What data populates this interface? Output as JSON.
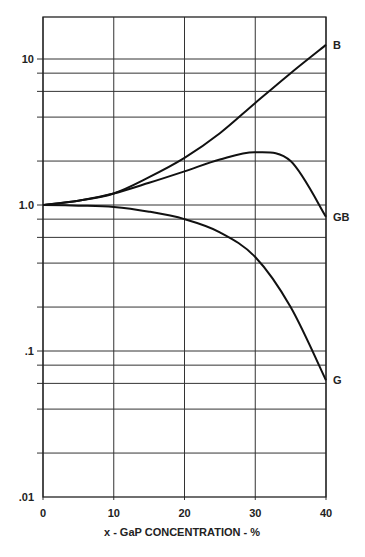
{
  "chart_data": {
    "type": "line",
    "title": "",
    "xlabel": "x - GaP CONCENTRATION - %",
    "ylabel": "",
    "yscale": "log",
    "xlim": [
      0,
      40
    ],
    "ylim": [
      0.01,
      20
    ],
    "grid": true,
    "x_ticks": [
      "0",
      "10",
      "20",
      "30",
      "40"
    ],
    "y_ticks": [
      ".01",
      ".1",
      "1.0",
      "10"
    ],
    "y_minor_grid": [
      0.02,
      0.04,
      0.06,
      0.08,
      0.2,
      0.4,
      0.6,
      0.8,
      2,
      4,
      6,
      8
    ],
    "x": [
      0,
      5,
      10,
      15,
      20,
      25,
      30,
      35,
      40
    ],
    "series": [
      {
        "name": "B",
        "values": [
          1.0,
          1.07,
          1.2,
          1.55,
          2.1,
          3.1,
          5.0,
          8.0,
          12.5
        ]
      },
      {
        "name": "GB",
        "values": [
          1.0,
          1.07,
          1.2,
          1.42,
          1.7,
          2.05,
          2.3,
          2.0,
          0.83
        ]
      },
      {
        "name": "G",
        "values": [
          1.0,
          0.99,
          0.97,
          0.9,
          0.8,
          0.65,
          0.44,
          0.2,
          0.063
        ]
      }
    ]
  }
}
